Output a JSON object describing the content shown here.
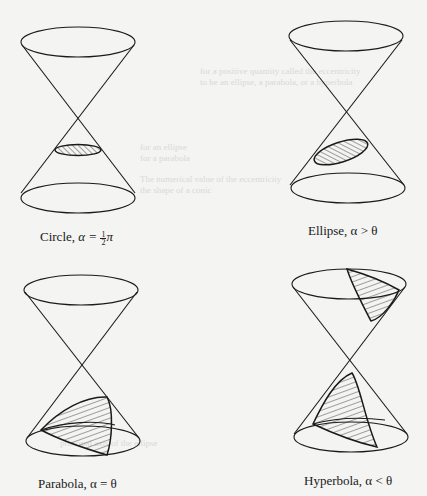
{
  "figure": {
    "panels": [
      {
        "id": "circle",
        "caption_name": "Circle",
        "caption_relation": "α =",
        "caption_frac_num": "1",
        "caption_frac_den": "2",
        "caption_tail": "π",
        "caption_full": "Circle, α = ½π"
      },
      {
        "id": "ellipse",
        "caption_full": "Ellipse, α > θ"
      },
      {
        "id": "parabola",
        "caption_full": "Parabola, α = θ"
      },
      {
        "id": "hyperbola",
        "caption_full": "Hyperbola, α < θ"
      }
    ]
  },
  "bleed_text": {
    "line1": "for a positive quantity called the eccentricity",
    "line2": "to be an ellipse, a parabola, or a hyperbola",
    "line3": "is an ellipse",
    "line4": "for an ellipse",
    "line5": "for a parabola",
    "line6": "The numerical value of the eccentricity",
    "line7": "the shape of a conic",
    "line8": "principal axis of the ellipse"
  },
  "colors": {
    "ink": "#1a1a1a",
    "paper": "#f4f4f2",
    "bleed": "#d9d9d6"
  }
}
